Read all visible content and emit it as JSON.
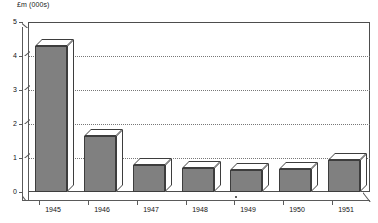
{
  "chart_data": {
    "type": "bar",
    "title": "",
    "subtitle": "",
    "ylabel": "£m (000s)",
    "xlabel": "",
    "categories": [
      "1945",
      "1946",
      "1947",
      "1948",
      "1949",
      "1950",
      "1951"
    ],
    "values": [
      4.3,
      1.65,
      0.8,
      0.72,
      0.65,
      0.68,
      0.95
    ],
    "series": [
      {
        "name": "£m (000s)",
        "values": [
          4.3,
          1.65,
          0.8,
          0.72,
          0.65,
          0.68,
          0.95
        ]
      }
    ],
    "ylim": [
      0,
      5
    ],
    "yticks": [
      0,
      1,
      2,
      3,
      4,
      5
    ],
    "ytick_labels": [
      "0",
      "1",
      "2",
      "3",
      "4",
      "5"
    ],
    "grid": "horizontal-dotted",
    "gridlines_at": [
      1,
      2,
      3,
      4
    ],
    "legend": "none",
    "style": "3d-column",
    "colors": {
      "bar_fill": "#808080",
      "bar_outline": "#3d3d3d",
      "bar_highlight": "#ffffff",
      "plot_background": "#ffffff",
      "axis": "#5a5a5a",
      "gridline": "#777777",
      "text": "#111111"
    }
  }
}
